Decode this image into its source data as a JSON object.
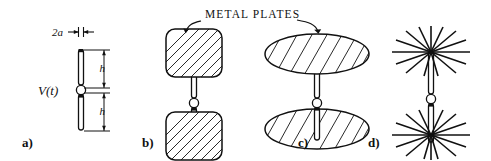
{
  "figure": {
    "background_color": "#ffffff",
    "ink_color": "#111111",
    "callout": {
      "text": "METAL PLATES",
      "name": "metal-plates-callout"
    },
    "panels": [
      {
        "id": "a",
        "label": "a)",
        "name": "panel-a-thin-dipole",
        "annotations": {
          "radius_label": "2a",
          "height_label_top": "h",
          "height_label_bottom": "h",
          "source_label": "V(t)"
        }
      },
      {
        "id": "b",
        "label": "b)",
        "name": "panel-b-square-plate-dipole"
      },
      {
        "id": "c",
        "label": "c)",
        "name": "panel-c-disc-plate-dipole"
      },
      {
        "id": "d",
        "label": "d)",
        "name": "panel-d-radial-wire-dipole"
      }
    ]
  }
}
